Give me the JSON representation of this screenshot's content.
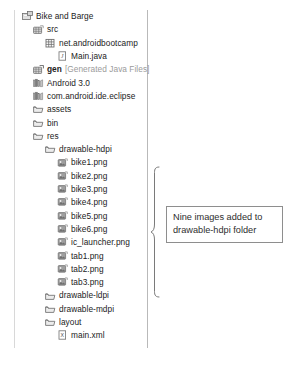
{
  "panel": {
    "name": "package-explorer",
    "border_color": "#b9b9b9"
  },
  "tree": {
    "rows": [
      {
        "depth": 0,
        "icon": "project-icon",
        "label": "Bike and Barge",
        "style": "normal",
        "suffix": ""
      },
      {
        "depth": 1,
        "icon": "source-folder-icon",
        "label": "src",
        "style": "normal",
        "suffix": ""
      },
      {
        "depth": 2,
        "icon": "package-icon",
        "label": "net.androidbootcamp",
        "style": "normal",
        "suffix": ""
      },
      {
        "depth": 3,
        "icon": "java-file-icon",
        "label": "Main.java",
        "style": "normal",
        "suffix": ""
      },
      {
        "depth": 1,
        "icon": "generated-folder-icon",
        "label": "gen",
        "style": "bold",
        "suffix": "[Generated Java Files]"
      },
      {
        "depth": 1,
        "icon": "library-icon",
        "label": "Android 3.0",
        "style": "normal",
        "suffix": ""
      },
      {
        "depth": 1,
        "icon": "library-icon",
        "label": "com.android.ide.eclipse",
        "style": "normal",
        "suffix": ""
      },
      {
        "depth": 1,
        "icon": "folder-icon",
        "label": "assets",
        "style": "normal",
        "suffix": ""
      },
      {
        "depth": 1,
        "icon": "folder-icon",
        "label": "bin",
        "style": "normal",
        "suffix": ""
      },
      {
        "depth": 1,
        "icon": "folder-icon",
        "label": "res",
        "style": "normal",
        "suffix": ""
      },
      {
        "depth": 2,
        "icon": "folder-icon",
        "label": "drawable-hdpi",
        "style": "normal",
        "suffix": ""
      },
      {
        "depth": 3,
        "icon": "image-file-icon",
        "label": "bike1.png",
        "style": "normal",
        "suffix": ""
      },
      {
        "depth": 3,
        "icon": "image-file-icon",
        "label": "bike2.png",
        "style": "normal",
        "suffix": ""
      },
      {
        "depth": 3,
        "icon": "image-file-icon",
        "label": "bike3.png",
        "style": "normal",
        "suffix": ""
      },
      {
        "depth": 3,
        "icon": "image-file-icon",
        "label": "bike4.png",
        "style": "normal",
        "suffix": ""
      },
      {
        "depth": 3,
        "icon": "image-file-icon",
        "label": "bike5.png",
        "style": "normal",
        "suffix": ""
      },
      {
        "depth": 3,
        "icon": "image-file-icon",
        "label": "bike6.png",
        "style": "normal",
        "suffix": ""
      },
      {
        "depth": 3,
        "icon": "image-file-icon",
        "label": "ic_launcher.png",
        "style": "normal",
        "suffix": ""
      },
      {
        "depth": 3,
        "icon": "image-file-icon",
        "label": "tab1.png",
        "style": "normal",
        "suffix": ""
      },
      {
        "depth": 3,
        "icon": "image-file-icon",
        "label": "tab2.png",
        "style": "normal",
        "suffix": ""
      },
      {
        "depth": 3,
        "icon": "image-file-icon",
        "label": "tab3.png",
        "style": "normal",
        "suffix": ""
      },
      {
        "depth": 2,
        "icon": "folder-icon",
        "label": "drawable-ldpi",
        "style": "normal",
        "suffix": ""
      },
      {
        "depth": 2,
        "icon": "folder-icon",
        "label": "drawable-mdpi",
        "style": "normal",
        "suffix": ""
      },
      {
        "depth": 2,
        "icon": "folder-icon",
        "label": "layout",
        "style": "normal",
        "suffix": ""
      },
      {
        "depth": 3,
        "icon": "xml-file-icon",
        "label": "main.xml",
        "style": "normal",
        "suffix": ""
      }
    ]
  },
  "callout": {
    "line1": "Nine images added to",
    "line2": "drawable-hdpi folder",
    "border_color": "#8e8e8e",
    "brace_color": "#7a7a7a"
  }
}
